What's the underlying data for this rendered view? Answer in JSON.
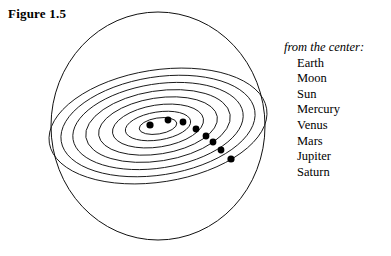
{
  "figure": {
    "title": "Figure 1.5"
  },
  "legend": {
    "heading": "from the center:",
    "items": [
      {
        "label": "Earth"
      },
      {
        "label": "Moon"
      },
      {
        "label": "Sun"
      },
      {
        "label": "Mercury"
      },
      {
        "label": "Venus"
      },
      {
        "label": "Mars"
      },
      {
        "label": "Jupiter"
      },
      {
        "label": "Saturn"
      }
    ]
  },
  "diagram": {
    "type": "geocentric-cosmos",
    "stroke_color": "#111111",
    "fill_color": "#000000",
    "background_color": "#ffffff",
    "sphere": {
      "center_x": 158,
      "center_y": 126,
      "radius_x": 107,
      "radius_y": 114
    },
    "orbit_tilt_degrees": -9,
    "orbits": [
      {
        "body": "Earth",
        "radius_x": 19,
        "radius_y": 8
      },
      {
        "body": "Moon",
        "radius_x": 33,
        "radius_y": 14
      },
      {
        "body": "Sun",
        "radius_x": 46,
        "radius_y": 21
      },
      {
        "body": "Mercury",
        "radius_x": 60,
        "radius_y": 28
      },
      {
        "body": "Venus",
        "radius_x": 73,
        "radius_y": 35
      },
      {
        "body": "Mars",
        "radius_x": 86,
        "radius_y": 42
      },
      {
        "body": "Jupiter",
        "radius_x": 98,
        "radius_y": 49
      },
      {
        "body": "Saturn",
        "radius_x": 110,
        "radius_y": 56
      }
    ],
    "bodies": [
      {
        "label": "Earth",
        "x": 150,
        "y": 125,
        "r": 3.6
      },
      {
        "label": "Moon",
        "x": 168,
        "y": 120,
        "r": 3.4
      },
      {
        "label": "Sun",
        "x": 183,
        "y": 122,
        "r": 3.4
      },
      {
        "label": "Mercury",
        "x": 196,
        "y": 129,
        "r": 3.4
      },
      {
        "label": "Venus",
        "x": 206,
        "y": 136,
        "r": 3.4
      },
      {
        "label": "Mars",
        "x": 213,
        "y": 142,
        "r": 3.4
      },
      {
        "label": "Jupiter",
        "x": 221,
        "y": 150,
        "r": 3.4
      },
      {
        "label": "Saturn",
        "x": 231,
        "y": 159,
        "r": 3.6
      }
    ]
  }
}
